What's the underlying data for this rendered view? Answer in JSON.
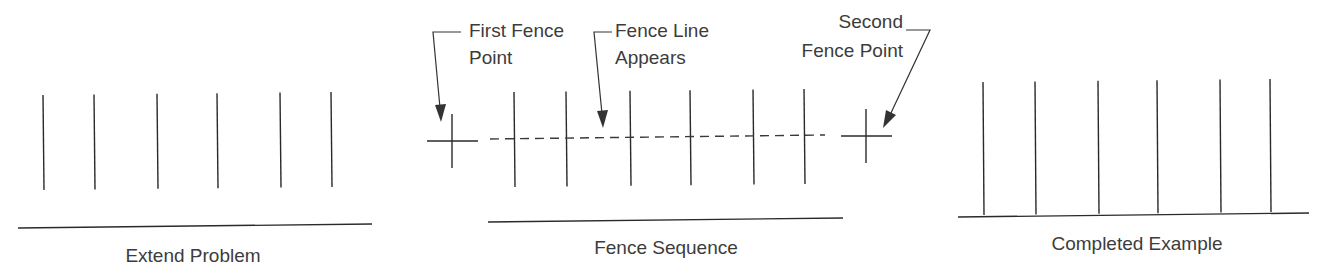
{
  "panels": [
    {
      "id": "extend-problem",
      "label": "Extend Problem",
      "posts_x": [
        43,
        94,
        157,
        217,
        280,
        331
      ],
      "posts_top": 95,
      "posts_bottom": 190,
      "baseline": {
        "x1": 18,
        "y1": 228,
        "x2": 372,
        "y2": 224
      }
    },
    {
      "id": "fence-sequence",
      "label": "Fence Sequence",
      "posts_x": [
        514,
        566,
        630,
        690,
        753,
        804
      ],
      "posts_top": 92,
      "posts_bottom": 187,
      "baseline": {
        "x1": 488,
        "y1": 222,
        "x2": 843,
        "y2": 218
      },
      "first_point": {
        "x": 452,
        "y": 141
      },
      "second_point": {
        "x": 866,
        "y": 136
      },
      "fence_line": {
        "x1": 490,
        "y1": 139,
        "x2": 825,
        "y2": 135
      },
      "callouts": {
        "first_fence_point": [
          "First Fence",
          "Point"
        ],
        "fence_line_appears": [
          "Fence Line",
          "Appears"
        ],
        "second_fence_point": [
          "Second",
          "Fence Point"
        ]
      }
    },
    {
      "id": "completed-example",
      "label": "Completed Example",
      "posts_x": [
        983,
        1035,
        1098,
        1157,
        1220,
        1270
      ],
      "posts_top": 82,
      "posts_bottom": 215,
      "baseline": {
        "x1": 958,
        "y1": 217,
        "x2": 1309,
        "y2": 213
      }
    }
  ]
}
